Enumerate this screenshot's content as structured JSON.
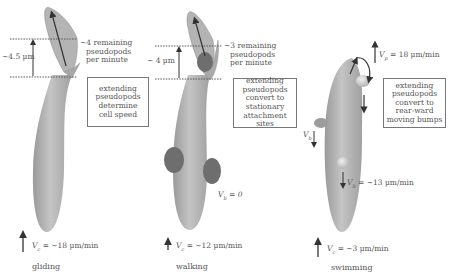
{
  "panels": [
    {
      "mode": "gliding",
      "displacement": "~4.5 µm",
      "pseudopod_rate": [
        "~4 remaining",
        "pseudopods",
        "per minute"
      ],
      "box_text": [
        "extending",
        "pseudopods",
        "determine",
        "cell speed"
      ],
      "cell_velocity_symbol": "V",
      "cell_velocity_sub": "c",
      "cell_velocity_value": "= ~18 µm/min"
    },
    {
      "mode": "walking",
      "displacement": "~ 4 µm",
      "pseudopod_rate": [
        "~3 remaining",
        "pseudopods",
        "per minute"
      ],
      "box_text": [
        "extending",
        "pseudopods",
        "convert to",
        "stationary",
        "attachment sites"
      ],
      "bump_velocity_symbol": "V",
      "bump_velocity_sub": "b",
      "bump_velocity_value": "= 0",
      "cell_velocity_symbol": "V",
      "cell_velocity_sub": "c",
      "cell_velocity_value": "= ~12 µm/min"
    },
    {
      "mode": "swimming",
      "pseudopod_velocity_symbol": "V",
      "pseudopod_velocity_sub": "p",
      "pseudopod_velocity_value": "= 18 µm/min",
      "box_text": [
        "extending",
        "pseudopods",
        "convert to",
        "rear-ward",
        "moving bumps"
      ],
      "bump_velocity_symbol": "V",
      "bump_velocity_sub": "b",
      "bump_velocity_value": "= ~13 µm/min",
      "cell_velocity_symbol": "V",
      "cell_velocity_sub": "c",
      "cell_velocity_value": "= ~3 µm/min"
    }
  ],
  "colors": {
    "cell_body": "#a8a8a8",
    "cell_highlight": "#c8c8c8",
    "attachment_blob": "#6e6e6e",
    "arrow": "#333333",
    "dotted_line": "#555555"
  }
}
